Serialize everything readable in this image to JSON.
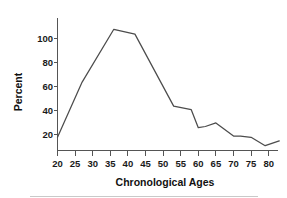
{
  "chart_data": {
    "type": "line",
    "title": "",
    "subtitle": "",
    "xlabel": "Chronological Ages",
    "ylabel": "Percent",
    "xlim": [
      18,
      84
    ],
    "ylim": [
      0,
      110
    ],
    "xticks": [
      20,
      25,
      30,
      35,
      40,
      45,
      50,
      55,
      60,
      65,
      70,
      75,
      80
    ],
    "xtick_labels": [
      "20",
      "25",
      "30",
      "35",
      "40",
      "45",
      "50",
      "55",
      "60",
      "65",
      "70",
      "75",
      "80"
    ],
    "yticks": [
      20,
      40,
      60,
      80,
      100
    ],
    "ytick_labels": [
      "20",
      "40",
      "60",
      "80",
      "100"
    ],
    "grid": false,
    "legend": false,
    "legend_position": "none",
    "line_color": "#4c4c4c",
    "axis_color": "#555555",
    "series": [
      {
        "name": "Percent",
        "x": [
          20,
          27,
          36,
          42,
          53,
          58,
          60,
          62,
          65,
          70,
          72,
          75,
          79,
          83
        ],
        "values": [
          11,
          57,
          101,
          97,
          37,
          34,
          19,
          20,
          23,
          12,
          12,
          11,
          4,
          8
        ]
      }
    ],
    "points": [
      {
        "x": 20,
        "y": 11
      },
      {
        "x": 27,
        "y": 57
      },
      {
        "x": 36,
        "y": 101
      },
      {
        "x": 42,
        "y": 97
      },
      {
        "x": 53,
        "y": 37
      },
      {
        "x": 58,
        "y": 34
      },
      {
        "x": 60,
        "y": 19
      },
      {
        "x": 62,
        "y": 20
      },
      {
        "x": 65,
        "y": 23
      },
      {
        "x": 70,
        "y": 12
      },
      {
        "x": 72,
        "y": 12
      },
      {
        "x": 75,
        "y": 11
      },
      {
        "x": 79,
        "y": 4
      },
      {
        "x": 83,
        "y": 8
      }
    ]
  },
  "axes": {
    "x_title": "Chronological Ages",
    "y_title": "Percent"
  },
  "ticks": {
    "x": [
      "20",
      "25",
      "30",
      "35",
      "40",
      "45",
      "50",
      "55",
      "60",
      "65",
      "70",
      "75",
      "80"
    ],
    "y": [
      "100",
      "80",
      "60",
      "40",
      "20"
    ]
  }
}
